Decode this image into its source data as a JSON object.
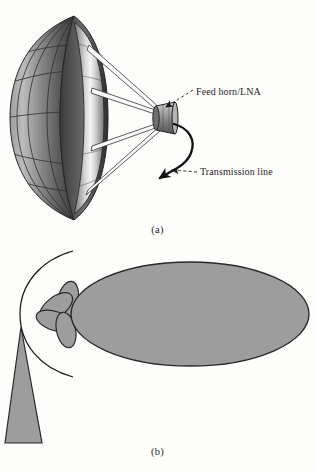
{
  "figure": {
    "background_color": "#fdfdfb",
    "ink_color": "#1f1f1f"
  },
  "panel_a": {
    "caption": "(a)",
    "description": "Perspective view of a parabolic reflector (dish) antenna with mesh surface, four support struts converging on a feed horn, and a curved transmission line",
    "labels": [
      {
        "id": "feed-horn",
        "text": "Feed horn/LNA",
        "leader": "dashed",
        "arrow_target": "feed-horn-body"
      },
      {
        "id": "transmission-line",
        "text": "Transmission line",
        "leader": "dashed",
        "arrow_target": "transmission-line-curve"
      }
    ],
    "colors": {
      "dish_dark": "#4a4a4a",
      "dish_mid": "#8d8d8d",
      "dish_light": "#f2f2f2",
      "rim_dark": "#3c3c3c",
      "strut": "#ffffff",
      "strut_edge": "#2b2b2b",
      "feed_horn_body": "#9a9a9a",
      "line": "#121212"
    },
    "strut_count": 4
  },
  "panel_b": {
    "caption": "(b)",
    "description": "Antenna radiation pattern showing a large main lobe, four side lobes, a narrow back lobe and a reference arc",
    "lobes": [
      {
        "id": "main-lobe",
        "name": "main lobe",
        "shape": "ellipse"
      },
      {
        "id": "side-lobe-1",
        "name": "side lobe",
        "shape": "ellipse"
      },
      {
        "id": "side-lobe-2",
        "name": "side lobe",
        "shape": "ellipse"
      },
      {
        "id": "side-lobe-3",
        "name": "side lobe",
        "shape": "ellipse"
      },
      {
        "id": "side-lobe-4",
        "name": "side lobe",
        "shape": "ellipse"
      },
      {
        "id": "back-lobe",
        "name": "back lobe",
        "shape": "triangle"
      }
    ],
    "colors": {
      "lobe_fill": "#9d9d9d",
      "lobe_stroke": "#2a2a2a",
      "arc_stroke": "#1a1a1a"
    }
  }
}
